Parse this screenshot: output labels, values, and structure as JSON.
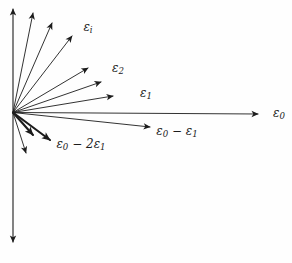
{
  "figure": {
    "colors": {
      "ink": "#1c1c1c",
      "background": "#fefefe"
    },
    "origin": {
      "x": 13,
      "y": 112.5
    },
    "axis": {
      "name": "vertical-axis",
      "x1": 13,
      "y1": 242,
      "x2": 13,
      "y2": 9,
      "double_headed": true
    },
    "arrows": [
      {
        "name": "arrow-fan-upper-1",
        "x2": 33,
        "y2": 13,
        "bold": false,
        "label": ""
      },
      {
        "name": "arrow-fan-upper-2",
        "x2": 52,
        "y2": 23,
        "bold": false,
        "label": ""
      },
      {
        "name": "arrow-epsilon-i",
        "x2": 72,
        "y2": 36,
        "bold": false,
        "label": "epsilon_i"
      },
      {
        "name": "arrow-fan-upper-4",
        "x2": 88,
        "y2": 68,
        "bold": false,
        "label": ""
      },
      {
        "name": "arrow-epsilon-2",
        "x2": 101,
        "y2": 82,
        "bold": false,
        "label": "epsilon_2"
      },
      {
        "name": "arrow-epsilon-1",
        "x2": 113,
        "y2": 96,
        "bold": false,
        "label": "epsilon_1"
      },
      {
        "name": "arrow-epsilon-0",
        "x2": 258,
        "y2": 114,
        "bold": false,
        "label": "epsilon_0"
      },
      {
        "name": "arrow-epsilon-0-minus-eps-1",
        "x2": 150,
        "y2": 127,
        "bold": false,
        "label": "epsilon_0 - epsilon_1"
      },
      {
        "name": "arrow-bold-short",
        "x2": 33,
        "y2": 135,
        "bold": true,
        "label": ""
      },
      {
        "name": "arrow-epsilon-0-minus-2eps-1",
        "x2": 50,
        "y2": 140,
        "bold": true,
        "label": "epsilon_0 - 2 epsilon_1"
      },
      {
        "name": "arrow-fan-lower-steep",
        "x2": 26,
        "y2": 153,
        "bold": false,
        "label": ""
      }
    ],
    "labels": [
      {
        "name": "label-epsilon-i",
        "text": "εᵢ",
        "x": 88,
        "y": 27,
        "parts": [
          [
            "ε",
            0
          ],
          [
            "i",
            1
          ]
        ]
      },
      {
        "name": "label-epsilon-2",
        "text": "ε₂",
        "x": 118,
        "y": 68,
        "parts": [
          [
            "ε",
            0
          ],
          [
            "2",
            1
          ]
        ]
      },
      {
        "name": "label-epsilon-1",
        "text": "ε₁",
        "x": 146,
        "y": 93,
        "parts": [
          [
            "ε",
            0
          ],
          [
            "1",
            1
          ]
        ]
      },
      {
        "name": "label-epsilon-0",
        "text": "ε₀",
        "x": 279,
        "y": 113,
        "parts": [
          [
            "ε",
            0
          ],
          [
            "0",
            1
          ]
        ]
      },
      {
        "name": "label-epsilon-0-minus-eps-1",
        "text": "ε₀ − ε₁",
        "x": 177,
        "y": 131,
        "parts": [
          [
            "ε",
            0
          ],
          [
            "0",
            1
          ],
          [
            " − ",
            0
          ],
          [
            "ε",
            0
          ],
          [
            "1",
            1
          ]
        ]
      },
      {
        "name": "label-epsilon-0-minus-2eps-1",
        "text": "ε₀ − 2ε₁",
        "x": 81,
        "y": 144,
        "parts": [
          [
            "ε",
            0
          ],
          [
            "0",
            1
          ],
          [
            " − 2",
            0
          ],
          [
            "ε",
            0
          ],
          [
            "1",
            1
          ]
        ]
      }
    ]
  }
}
